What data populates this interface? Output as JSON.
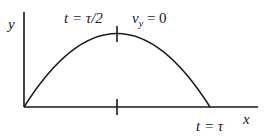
{
  "diagram": {
    "type": "projectile-trajectory",
    "axes": {
      "x_label": "x",
      "y_label": "y"
    },
    "annotations": {
      "peak_time": "t = τ/2",
      "peak_velocity_var": "v",
      "peak_velocity_sub": "y",
      "peak_velocity_value": " = 0",
      "end_time": "t = τ"
    },
    "colors": {
      "line": "#1a1a1a",
      "background": "#ffffff"
    }
  }
}
